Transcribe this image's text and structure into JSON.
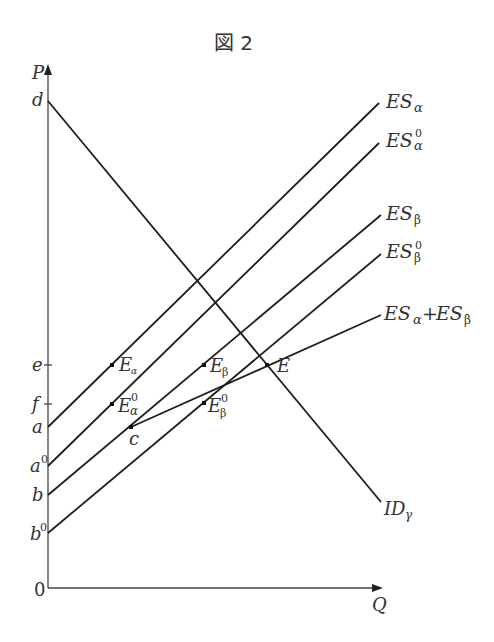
{
  "figure": {
    "title": "図 2",
    "axes": {
      "y_label": "P",
      "x_label": "Q",
      "origin_label": "0"
    },
    "y_ticks": [
      {
        "id": "d",
        "label": "d",
        "y": 101
      },
      {
        "id": "e",
        "label": "e",
        "y": 365
      },
      {
        "id": "f",
        "label": "f",
        "y": 404
      },
      {
        "id": "a",
        "label": "a",
        "y": 427
      },
      {
        "id": "a0",
        "label": "a",
        "sup": "0",
        "y": 466
      },
      {
        "id": "b",
        "label": "b",
        "y": 495
      },
      {
        "id": "b0",
        "label": "b",
        "sup": "0",
        "y": 533
      }
    ],
    "curves": [
      {
        "id": "ES_alpha",
        "label": "ES",
        "sub": "α",
        "sup": "",
        "x1": 48,
        "y1": 427,
        "x2": 379,
        "y2": 103
      },
      {
        "id": "ES_alpha0",
        "label": "ES",
        "sub": "α",
        "sup": "0",
        "x1": 48,
        "y1": 466,
        "x2": 379,
        "y2": 143
      },
      {
        "id": "ES_beta",
        "label": "ES",
        "sub": "β",
        "sup": "",
        "x1": 48,
        "y1": 495,
        "x2": 381,
        "y2": 215
      },
      {
        "id": "ES_beta0",
        "label": "ES",
        "sub": "β",
        "sup": "0",
        "x1": 48,
        "y1": 533,
        "x2": 381,
        "y2": 254
      },
      {
        "id": "ES_sum",
        "label": "ESα + ESβ",
        "x1": 131,
        "y1": 427,
        "x2": 381,
        "y2": 315
      },
      {
        "id": "ID_gamma",
        "label": "ID",
        "sub": "γ",
        "x1": 48,
        "y1": 101,
        "x2": 381,
        "y2": 502
      }
    ],
    "points": [
      {
        "id": "E_alpha",
        "label": "E",
        "sub": "α",
        "x": 112,
        "y": 365
      },
      {
        "id": "E_alpha0",
        "label": "E",
        "sub": "α",
        "sup": "0",
        "x": 112,
        "y": 404
      },
      {
        "id": "E_beta",
        "label": "E",
        "sub": "β",
        "x": 204,
        "y": 365
      },
      {
        "id": "E_beta0",
        "label": "E",
        "sub": "β",
        "sup": "0",
        "x": 204,
        "y": 403
      },
      {
        "id": "c",
        "label": "c",
        "x": 131,
        "y": 427
      },
      {
        "id": "E",
        "label": "E",
        "x": 267,
        "y": 365
      }
    ],
    "text": {
      "P": "P",
      "Q": "Q",
      "zero": "0",
      "d": "d",
      "e": "e",
      "f": "f",
      "a": "a",
      "a0": "a",
      "b": "b",
      "b0": "b",
      "sup0": "0",
      "ES": "ES",
      "alpha": "α",
      "beta": "β",
      "gamma": "γ",
      "plus": "+",
      "E": "E",
      "c": "c",
      "ID": "ID"
    }
  }
}
